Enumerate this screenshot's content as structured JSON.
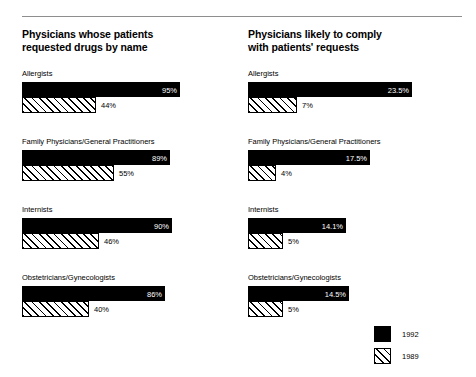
{
  "chart_data": {
    "type": "bar",
    "orientation": "horizontal",
    "title": "",
    "legend": {
      "position": "bottom-right",
      "entries": [
        {
          "name": "1992",
          "swatch": "solid-black"
        },
        {
          "name": "1989",
          "swatch": "diagonal-hatch"
        }
      ]
    },
    "panels": [
      {
        "title": "Physicians whose patients\nrequested drugs by name",
        "xlabel": "",
        "ylabel": "",
        "xlim": [
          0,
          100
        ],
        "grid": false,
        "categories": [
          "Allergists",
          "Family Physicians/General Practitioners",
          "Internists",
          "Obstetricians/Gynecologists"
        ],
        "series": [
          {
            "name": "1992",
            "values": [
              95,
              89,
              90,
              86
            ],
            "labels": [
              "95%",
              "89%",
              "90%",
              "86%"
            ]
          },
          {
            "name": "1989",
            "values": [
              44,
              55,
              46,
              40
            ],
            "labels": [
              "44%",
              "55%",
              "46%",
              "40%"
            ]
          }
        ]
      },
      {
        "title": "Physicians likely to comply\nwith patients' requests",
        "xlabel": "",
        "ylabel": "",
        "xlim": [
          0,
          25
        ],
        "grid": false,
        "categories": [
          "Allergists",
          "Family Physicians/General Practitioners",
          "Internists",
          "Obstetricians/Gynecologists"
        ],
        "series": [
          {
            "name": "1992",
            "values": [
              23.5,
              17.5,
              14.1,
              14.5
            ],
            "labels": [
              "23.5%",
              "17.5%",
              "14.1%",
              "14.5%"
            ]
          },
          {
            "name": "1989",
            "values": [
              7,
              4,
              5,
              5
            ],
            "labels": [
              "7%",
              "4%",
              "5%",
              "5%"
            ]
          }
        ]
      }
    ]
  },
  "colors": {
    "series_1992": "#000000",
    "series_1989_fill": "#ffffff",
    "series_1989_stroke": "#000000",
    "rule": "#8e8e8e",
    "background": "#ffffff"
  },
  "left": {
    "title": "Physicians whose patients\nrequested drugs by name",
    "groups": [
      {
        "category": "Allergists",
        "bar1992": {
          "label": "95%",
          "width_px": 158
        },
        "bar1989": {
          "label": "44%",
          "width_px": 74
        }
      },
      {
        "category": "Family Physicians/General Practitioners",
        "bar1992": {
          "label": "89%",
          "width_px": 148
        },
        "bar1989": {
          "label": "55%",
          "width_px": 92
        }
      },
      {
        "category": "Internists",
        "bar1992": {
          "label": "90%",
          "width_px": 150
        },
        "bar1989": {
          "label": "46%",
          "width_px": 77
        }
      },
      {
        "category": "Obstetricians/Gynecologists",
        "bar1992": {
          "label": "86%",
          "width_px": 143
        },
        "bar1989": {
          "label": "40%",
          "width_px": 67
        }
      }
    ]
  },
  "right": {
    "title": "Physicians likely to comply\nwith patients' requests",
    "groups": [
      {
        "category": "Allergists",
        "bar1992": {
          "label": "23.5%",
          "width_px": 164
        },
        "bar1989": {
          "label": "7%",
          "width_px": 49
        }
      },
      {
        "category": "Family Physicians/General Practitioners",
        "bar1992": {
          "label": "17.5%",
          "width_px": 122
        },
        "bar1989": {
          "label": "4%",
          "width_px": 28
        }
      },
      {
        "category": "Internists",
        "bar1992": {
          "label": "14.1%",
          "width_px": 98
        },
        "bar1989": {
          "label": "5%",
          "width_px": 35
        }
      },
      {
        "category": "Obstetricians/Gynecologists",
        "bar1992": {
          "label": "14.5%",
          "width_px": 101
        },
        "bar1989": {
          "label": "5%",
          "width_px": 35
        }
      }
    ]
  },
  "legend": {
    "items": [
      {
        "label": "1992"
      },
      {
        "label": "1989"
      }
    ]
  }
}
